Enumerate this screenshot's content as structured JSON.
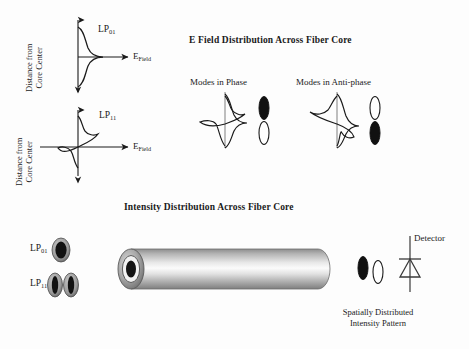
{
  "figure": {
    "background": "#fdfdfd",
    "ink": "#1a1a1a",
    "titles": {
      "efield": "E Field Distribution Across Fiber Core",
      "intensity": "Intensity Distribution Across Fiber Core"
    },
    "top_left_plots": [
      {
        "name": "lp01-plot",
        "mode_label_base": "LP",
        "mode_label_sub": "01",
        "y_axis_label_line1": "Distance from",
        "y_axis_label_line2": "Core Center",
        "x_axis_label_base": "E",
        "x_axis_label_sub": "Field",
        "profile": "gaussian-even-symmetric"
      },
      {
        "name": "lp11-plot",
        "mode_label_base": "LP",
        "mode_label_sub": "11",
        "y_axis_label_line1": "Distance from",
        "y_axis_label_line2": "Core Center",
        "x_axis_label_base": "E",
        "x_axis_label_sub": "Field",
        "profile": "odd-antisymmetric-two-lobe"
      }
    ],
    "superposition": [
      {
        "name": "modes-in-phase",
        "label": "Modes in Phase",
        "lobe_top": "filled",
        "lobe_bottom": "hollow"
      },
      {
        "name": "modes-in-anti-phase",
        "label": "Modes in Anti-phase",
        "lobe_top": "hollow",
        "lobe_bottom": "filled"
      }
    ],
    "intensity_section": {
      "mode_legend": [
        {
          "name": "lp01-intensity",
          "base": "LP",
          "sub": "01",
          "lobes": 1
        },
        {
          "name": "lp11-intensity",
          "base": "LP",
          "sub": "11",
          "lobes": 2
        }
      ],
      "fiber": {
        "name": "optical-fiber-cylinder",
        "core": "dark-circular-core"
      },
      "output_pattern": {
        "name": "spatially-distributed-intensity-pattern",
        "lobe_left": "filled",
        "lobe_right": "hollow",
        "caption_line1": "Spatially Distributed",
        "caption_line2": "Intensity Pattern"
      },
      "detector": {
        "name": "photodetector",
        "label": "Detector",
        "symbol": "diode-symbol"
      }
    }
  }
}
